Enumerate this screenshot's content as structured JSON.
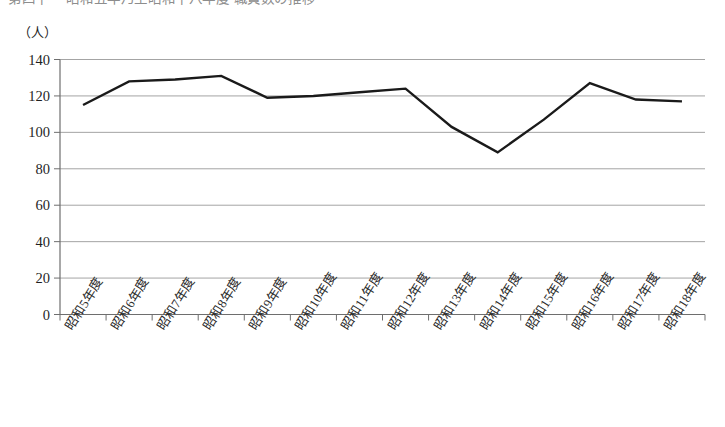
{
  "page": {
    "top_caption_partial": "第四十一 昭和五年乃至昭和十八年度 職員数の推移"
  },
  "chart_data": {
    "type": "line",
    "title": "",
    "xlabel": "",
    "ylabel": "",
    "unit_label": "（人）",
    "categories": [
      "昭和5年度",
      "昭和6年度",
      "昭和7年度",
      "昭和8年度",
      "昭和9年度",
      "昭和10年度",
      "昭和11年度",
      "昭和12年度",
      "昭和13年度",
      "昭和14年度",
      "昭和15年度",
      "昭和16年度",
      "昭和17年度",
      "昭和18年度"
    ],
    "values": [
      115,
      128,
      129,
      131,
      119,
      120,
      122,
      124,
      103,
      89,
      107,
      127,
      118,
      117
    ],
    "ylim": [
      0,
      140
    ],
    "yticks": [
      0,
      20,
      40,
      60,
      80,
      100,
      120,
      140
    ],
    "ytick_labels": [
      "0",
      "20",
      "40",
      "60",
      "80",
      "100",
      "120",
      "140"
    ],
    "grid": true,
    "grid_axis": "y",
    "legend": false,
    "legend_position": "none",
    "series_color": "#1a1a1a",
    "grid_color": "#9a9a9a",
    "axis_color": "#6e6e6e"
  }
}
